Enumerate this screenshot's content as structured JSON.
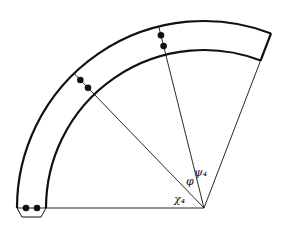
{
  "diagram": {
    "labels": {
      "phi": "φ",
      "psi4": "ψ₄",
      "chi4": "χ₄"
    },
    "colors": {
      "stroke": "#111111",
      "background": "#ffffff"
    },
    "sector": {
      "start_angle_deg": 180,
      "end_angle_deg": 69
    },
    "rays": [
      {
        "name": "horizontal-ray",
        "angle_deg": 180
      },
      {
        "name": "chi-ray",
        "angle_deg": 134
      },
      {
        "name": "phi-ray",
        "angle_deg": 104
      },
      {
        "name": "psi-ray",
        "angle_deg": 69
      }
    ],
    "dot_pairs": [
      {
        "name": "dots-bottom-left",
        "angle_deg": 180
      },
      {
        "name": "dots-middle",
        "angle_deg": 134
      },
      {
        "name": "dots-top",
        "angle_deg": 104
      }
    ]
  }
}
